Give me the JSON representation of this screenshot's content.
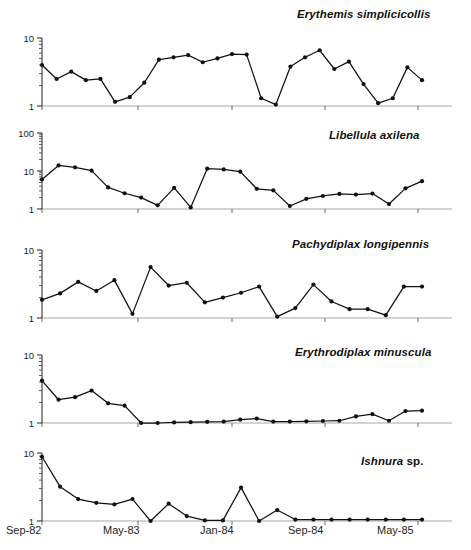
{
  "figure": {
    "panel_count": 5,
    "axis": {
      "x_tick_labels": [
        "Sep-82",
        "May-83",
        "Jan-84",
        "Sep-84",
        "May-85"
      ],
      "y_label_1": "1",
      "y_label_10": "10",
      "y_label_100": "100"
    }
  },
  "chart_data": [
    {
      "type": "line",
      "title": "Erythemis simplicicollis",
      "title_genus": "Erythemis simplicicollis",
      "title_suffix": "",
      "xlabel": "",
      "ylabel": "",
      "yscale": "log",
      "ylim": [
        1,
        10
      ],
      "ytick_labels": [
        "1",
        "10"
      ],
      "grid": false,
      "legend": "none",
      "x": [
        "Sep-82",
        "Oct-82",
        "Nov-82",
        "Dec-82",
        "Jan-83",
        "Feb-83",
        "Mar-83",
        "Apr-83",
        "May-83",
        "Jun-83",
        "Jul-83",
        "Aug-83",
        "Sep-83",
        "Oct-83",
        "Nov-83",
        "Dec-83",
        "Jan-84",
        "Feb-84",
        "Mar-84",
        "Apr-84",
        "May-84",
        "Jun-84",
        "Jul-84",
        "Aug-84",
        "Sep-84",
        "Oct-84",
        "Nov-84",
        "Dec-84",
        "Jan-85",
        "Feb-85",
        "Mar-85",
        "Apr-85",
        "May-85",
        "Jun-85",
        "Jul-85",
        "Aug-85",
        "Sep-85"
      ],
      "values": [
        4.0,
        2.5,
        3.2,
        2.4,
        2.5,
        1.15,
        1.35,
        2.2,
        4.8,
        5.2,
        5.6,
        4.4,
        5.0,
        5.8,
        5.7,
        1.3,
        1.05,
        3.8,
        5.2,
        6.6,
        3.5,
        4.5,
        2.1,
        1.1,
        1.3,
        3.7,
        2.4
      ]
    },
    {
      "type": "line",
      "title": "Libellula axilena",
      "title_genus": "Libellula axilena",
      "title_suffix": "",
      "xlabel": "",
      "ylabel": "",
      "yscale": "log",
      "ylim": [
        1,
        100
      ],
      "ytick_labels": [
        "1",
        "10",
        "100"
      ],
      "grid": false,
      "legend": "none",
      "x": [
        "Sep-82",
        "Nov-82",
        "Dec-82",
        "Jan-83",
        "Feb-83",
        "Mar-83",
        "Apr-83",
        "May-83",
        "Jun-83",
        "Jul-83",
        "Aug-83",
        "Sep-83",
        "Oct-83",
        "Nov-83",
        "Dec-83",
        "Jan-84",
        "Feb-84",
        "Mar-84",
        "Apr-84",
        "May-84",
        "Jun-84",
        "Jul-84",
        "Aug-84",
        "Sep-84",
        "Oct-84",
        "Nov-84",
        "Dec-84",
        "Jan-85",
        "Mar-85",
        "May-85",
        "Jul-85",
        "Sep-85"
      ],
      "values": [
        6.0,
        14.0,
        12.5,
        10.2,
        3.7,
        2.6,
        2.0,
        1.25,
        3.6,
        1.1,
        11.5,
        11.0,
        9.6,
        3.4,
        3.1,
        1.2,
        1.85,
        2.2,
        2.5,
        2.4,
        2.55,
        1.35,
        3.5,
        5.4
      ]
    },
    {
      "type": "line",
      "title": "Pachydiplax longipennis",
      "title_genus": "Pachydiplax longipennis",
      "title_suffix": "",
      "xlabel": "",
      "ylabel": "",
      "yscale": "log",
      "ylim": [
        1,
        10
      ],
      "ytick_labels": [
        "1",
        "10"
      ],
      "grid": false,
      "legend": "none",
      "x": [
        "Sep-82",
        "Nov-82",
        "Dec-82",
        "Jan-83",
        "Feb-83",
        "Mar-83",
        "Apr-83",
        "May-83",
        "Jun-83",
        "Jul-83",
        "Aug-83",
        "Sep-83",
        "Oct-83",
        "Nov-83",
        "Jan-84",
        "Feb-84",
        "Mar-84",
        "Apr-84",
        "May-84",
        "Jul-84",
        "Sep-84",
        "Nov-84",
        "Jan-85",
        "Mar-85",
        "May-85",
        "Jul-85",
        "Aug-85",
        "Sep-85"
      ],
      "values": [
        1.85,
        2.3,
        3.4,
        2.5,
        3.6,
        1.15,
        5.6,
        3.0,
        3.3,
        1.7,
        2.0,
        2.35,
        2.9,
        1.05,
        1.4,
        3.1,
        1.75,
        1.35,
        1.35,
        1.1,
        2.9,
        2.9
      ]
    },
    {
      "type": "line",
      "title": "Erythrodiplax minuscula",
      "title_genus": "Erythrodiplax minuscula",
      "title_suffix": "",
      "xlabel": "",
      "ylabel": "",
      "yscale": "log",
      "ylim": [
        1,
        10
      ],
      "ytick_labels": [
        "1",
        "10"
      ],
      "grid": false,
      "legend": "none",
      "x": [
        "Sep-82",
        "Oct-82",
        "Nov-82",
        "Dec-82",
        "Jan-83",
        "Feb-83",
        "Mar-83",
        "Apr-83",
        "May-83",
        "Jun-83",
        "Jul-83",
        "Aug-83",
        "Sep-83",
        "Oct-83",
        "Nov-83",
        "Dec-83",
        "Jan-84",
        "Feb-84",
        "Mar-84",
        "Apr-84",
        "May-84",
        "Jun-84",
        "Jul-84",
        "Aug-84",
        "Sep-84",
        "Oct-84",
        "Nov-84",
        "Dec-84",
        "Jan-85",
        "Feb-85",
        "Mar-85",
        "Apr-85",
        "May-85",
        "Jun-85",
        "Jul-85",
        "Aug-85",
        "Sep-85"
      ],
      "values": [
        4.2,
        2.2,
        2.4,
        3.0,
        1.95,
        1.8,
        1.0,
        1.0,
        1.02,
        1.03,
        1.04,
        1.05,
        1.12,
        1.16,
        1.05,
        1.05,
        1.06,
        1.07,
        1.08,
        1.25,
        1.35,
        1.08,
        1.5,
        1.52
      ]
    },
    {
      "type": "line",
      "title": "Ishnura sp.",
      "title_genus": "Ishnura",
      "title_suffix": " sp.",
      "xlabel": "",
      "ylabel": "",
      "yscale": "log",
      "ylim": [
        1,
        10
      ],
      "ytick_labels": [
        "1",
        "10"
      ],
      "grid": false,
      "legend": "none",
      "x": [
        "Sep-82",
        "Nov-82",
        "Dec-82",
        "Jan-83",
        "Feb-83",
        "Mar-83",
        "Apr-83",
        "May-83",
        "Jun-83",
        "Jul-83",
        "Aug-83",
        "Sep-83",
        "Oct-83",
        "Nov-83",
        "Jan-84",
        "Feb-84",
        "Mar-84",
        "Apr-84",
        "May-84",
        "Jun-84",
        "Jul-84",
        "Aug-84",
        "Sep-84",
        "Oct-84",
        "Nov-84",
        "Jan-85",
        "Mar-85",
        "Apr-85",
        "May-85",
        "Jul-85",
        "Aug-85",
        "Sep-85"
      ],
      "values": [
        8.8,
        3.2,
        2.1,
        1.85,
        1.75,
        2.1,
        1.0,
        1.8,
        1.18,
        1.02,
        1.02,
        3.1,
        1.0,
        1.45,
        1.05,
        1.05,
        1.05,
        1.05,
        1.05,
        1.05,
        1.05,
        1.05
      ]
    }
  ],
  "panel_geometry": [
    {
      "top": 28,
      "height": 88,
      "plot_top": 10,
      "plot_bottom": 78
    },
    {
      "top": 127,
      "height": 92,
      "plot_top": 6,
      "plot_bottom": 82
    },
    {
      "top": 240,
      "height": 88,
      "plot_top": 10,
      "plot_bottom": 78
    },
    {
      "top": 345,
      "height": 88,
      "plot_top": 10,
      "plot_bottom": 78
    },
    {
      "top": 443,
      "height": 88,
      "plot_top": 10,
      "plot_bottom": 78
    }
  ],
  "species_labels": [
    {
      "text": "Erythemis simplicicollis",
      "genus": "Erythemis simplicicollis",
      "suffix": "",
      "left": 297,
      "top": 8
    },
    {
      "text": "Libellula axilena",
      "genus": "Libellula axilena",
      "suffix": "",
      "left": 329,
      "top": 129
    },
    {
      "text": "Pachydiplax longipennis",
      "genus": "Pachydiplax longipennis",
      "suffix": "",
      "left": 292,
      "top": 238
    },
    {
      "text": "Erythrodiplax minuscula",
      "genus": "Erythrodiplax minuscula",
      "suffix": "",
      "left": 295,
      "top": 346
    },
    {
      "text": "Ishnura sp.",
      "genus": "Ishnura",
      "suffix": " sp.",
      "left": 361,
      "top": 455
    }
  ],
  "xaxis": {
    "labels": [
      {
        "text": "Sep-82",
        "left": 6
      },
      {
        "text": "May-83",
        "left": 103
      },
      {
        "text": "Jan-84",
        "left": 200
      },
      {
        "text": "Sep-84",
        "left": 288
      },
      {
        "text": "May-85",
        "left": 377
      }
    ],
    "tick_positions": [
      42,
      138,
      232,
      325,
      418
    ],
    "plot_left": 42,
    "plot_right": 452
  }
}
